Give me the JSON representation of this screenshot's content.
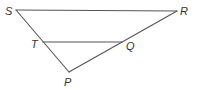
{
  "diagram": {
    "type": "geometry-figure",
    "colors": {
      "line": "#555555",
      "label": "#333333",
      "background": "#ffffff"
    },
    "points": {
      "S": {
        "label": "S",
        "x": 16,
        "y": 10
      },
      "R": {
        "label": "R",
        "x": 177,
        "y": 11
      },
      "T": {
        "label": "T",
        "x": 43,
        "y": 42
      },
      "Q": {
        "label": "Q",
        "x": 122,
        "y": 42
      },
      "P": {
        "label": "P",
        "x": 69,
        "y": 72
      }
    },
    "segments": [
      {
        "name": "SR",
        "from": "S",
        "to": "R"
      },
      {
        "name": "SP",
        "from": "S",
        "to": "P"
      },
      {
        "name": "PR",
        "from": "P",
        "to": "R"
      },
      {
        "name": "TQ",
        "from": "T",
        "to": "Q"
      }
    ],
    "labels": {
      "S": "S",
      "R": "R",
      "T": "T",
      "Q": "Q",
      "P": "P"
    }
  }
}
